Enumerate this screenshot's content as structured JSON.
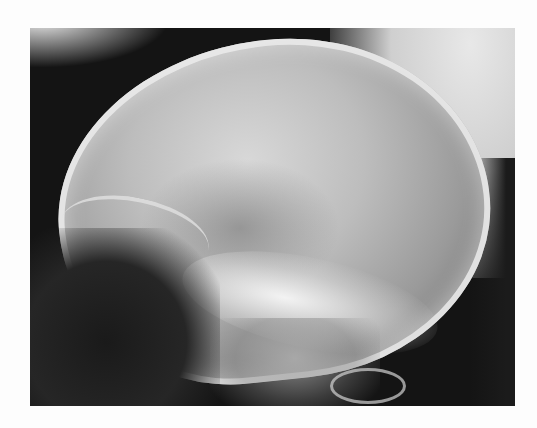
{
  "image": {
    "subject": "Lateral skull radiograph",
    "colors": {
      "page_background": "#fdfdfd",
      "film_background": "#141414",
      "bone_bright": "#e8e8e8",
      "soft_tissue_gray": "#9a9a9a"
    }
  }
}
